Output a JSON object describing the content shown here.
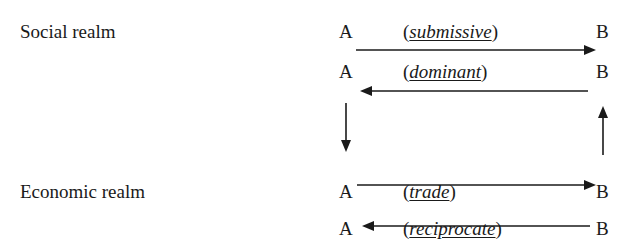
{
  "realms": [
    {
      "label": "Social realm"
    },
    {
      "label": "Economic realm"
    }
  ],
  "rows": [
    {
      "left": "A",
      "right": "B",
      "relation": "submissive",
      "direction": "A-to-B"
    },
    {
      "left": "A",
      "right": "B",
      "relation": "dominant",
      "direction": "B-to-A"
    },
    {
      "left": "A",
      "right": "B",
      "relation": "trade",
      "direction": "A-to-B"
    },
    {
      "left": "A",
      "right": "B",
      "relation": "reciprocate",
      "direction": "B-to-A"
    }
  ],
  "vertical_arrows": [
    {
      "side": "A",
      "direction": "down"
    },
    {
      "side": "B",
      "direction": "up"
    }
  ]
}
